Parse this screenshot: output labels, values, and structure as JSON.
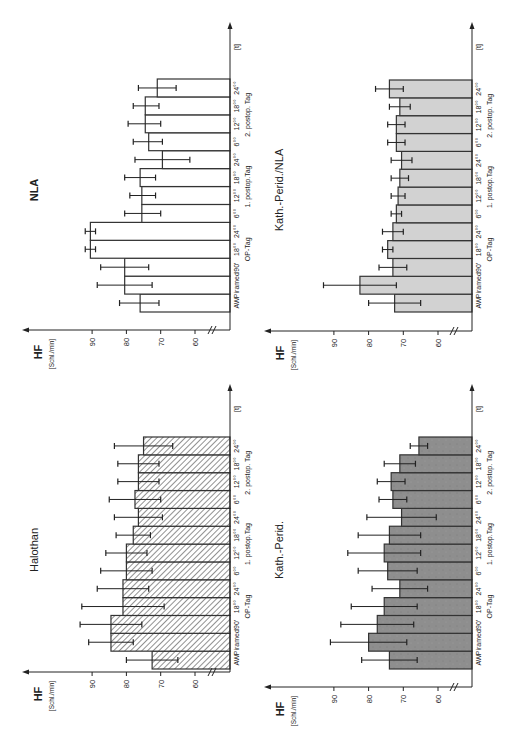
{
  "figure": {
    "y_axis_label": "HF",
    "y_axis_unit": "[Schl./min]",
    "time_axis_label": "[t]",
    "y_ticks": [
      60,
      70,
      80,
      90
    ],
    "time_labels": [
      "AW",
      "Piramed",
      "90'",
      "18°°",
      "24°°",
      "6°°",
      "12°°",
      "18°°",
      "24°°",
      "6°°",
      "12°°",
      "18°°",
      "24°°"
    ],
    "group_labels": [
      {
        "label": "OP-Tag",
        "from": 2,
        "to": 4
      },
      {
        "label": "1. postop.Tag",
        "from": 5,
        "to": 8
      },
      {
        "label": "2. postop. Tag",
        "from": 9,
        "to": 12
      }
    ]
  },
  "chart_data": [
    {
      "type": "bar",
      "title": "NLA",
      "xlabel": "[t]",
      "ylabel": "HF [Schl./min]",
      "ylim": [
        55,
        95
      ],
      "fill": "white",
      "categories": [
        "AW",
        "Piramed",
        "90'",
        "OP-Tag 18°°",
        "OP-Tag 24°°",
        "1. postop. 6°°",
        "1. postop. 12°°",
        "1. postop. 18°°",
        "1. postop. 24°°",
        "2. postop. 6°°",
        "2. postop. 12°°",
        "2. postop. 18°°",
        "2. postop. 24°°"
      ],
      "values": [
        76,
        80.5,
        80.5,
        90.5,
        90.5,
        75.5,
        75.5,
        76,
        69.5,
        73.5,
        74.5,
        74.5,
        71
      ],
      "error_minus": [
        5.5,
        8,
        7,
        1.5,
        1.5,
        5.5,
        4,
        4.5,
        8,
        4,
        4.5,
        4,
        5.5
      ],
      "error_plus": [
        6,
        8,
        7,
        1.5,
        1.5,
        5,
        3.5,
        4.5,
        8,
        4.5,
        5,
        3.5,
        5.5
      ],
      "grid": false,
      "orientation": "rotated 90° (bars extend left, time axis vertical)"
    },
    {
      "type": "bar",
      "title": "Kath.-Perid./NLA",
      "xlabel": "[t]",
      "ylabel": "HF [Schl./min]",
      "ylim": [
        55,
        95
      ],
      "fill": "light gray",
      "categories": [
        "AW",
        "Piramed",
        "90'",
        "OP-Tag 18°°",
        "OP-Tag 24°°",
        "1. postop. 6°°",
        "1. postop. 12°°",
        "1. postop. 18°°",
        "1. postop. 24°°",
        "2. postop. 6°°",
        "2. postop. 12°°",
        "2. postop. 18°°",
        "2. postop. 24°°"
      ],
      "values": [
        72.5,
        82.5,
        73,
        74.5,
        73,
        72,
        71.5,
        71,
        70.5,
        72,
        72,
        71,
        74
      ],
      "error_minus": [
        7.5,
        10.5,
        4,
        1.5,
        3,
        1.5,
        2,
        2.5,
        3,
        2.5,
        2.5,
        3,
        4
      ],
      "error_plus": [
        7.5,
        10.5,
        4,
        1.5,
        3,
        1.5,
        2,
        2.5,
        3,
        2.5,
        2.5,
        3,
        4
      ],
      "grid": false,
      "orientation": "rotated 90° (bars extend left, time axis vertical)"
    },
    {
      "type": "bar",
      "title": "Halothan",
      "xlabel": "[t]",
      "ylabel": "HF [Schl./min]",
      "ylim": [
        55,
        95
      ],
      "fill": "diagonal hatch",
      "categories": [
        "AW",
        "Piramed",
        "90'",
        "OP-Tag 18°°",
        "OP-Tag 24°°",
        "1. postop. 6°°",
        "1. postop. 12°°",
        "1. postop. 18°°",
        "1. postop. 24°°",
        "2. postop. 6°°",
        "2. postop. 12°°",
        "2. postop. 18°°",
        "2. postop. 24°°"
      ],
      "values": [
        72.5,
        84.5,
        84.5,
        81,
        81,
        80,
        80,
        78,
        76.5,
        77.5,
        76.5,
        76.5,
        75
      ],
      "error_minus": [
        7.5,
        6.5,
        9,
        12,
        7.5,
        7.5,
        6,
        5,
        7,
        7.5,
        6,
        6,
        8.5
      ],
      "error_plus": [
        7.5,
        6.5,
        9,
        12,
        7.5,
        7.5,
        6,
        5,
        7,
        7.5,
        6,
        6,
        8.5
      ],
      "grid": false,
      "orientation": "rotated 90° (bars extend left, time axis vertical)"
    },
    {
      "type": "bar",
      "title": "Kath.-Perid.",
      "xlabel": "[t]",
      "ylabel": "HF [Schl./min]",
      "ylim": [
        55,
        95
      ],
      "fill": "dark gray",
      "categories": [
        "AW",
        "Piramed",
        "90'",
        "OP-Tag 18°°",
        "OP-Tag 24°°",
        "1. postop. 6°°",
        "1. postop. 12°°",
        "1. postop. 18°°",
        "1. postop. 24°°",
        "2. postop. 6°°",
        "2. postop. 12°°",
        "2. postop. 18°°",
        "2. postop. 24°°"
      ],
      "values": [
        74,
        80,
        77.5,
        75.5,
        71,
        74.5,
        75.5,
        74,
        70.5,
        73,
        73.5,
        71,
        65.5
      ],
      "error_minus": [
        8,
        11,
        10.5,
        9.5,
        8,
        8.5,
        10.5,
        9,
        10,
        4,
        4,
        4.5,
        2.5
      ],
      "error_plus": [
        8,
        11,
        10.5,
        9.5,
        8,
        8.5,
        10.5,
        9,
        10,
        4,
        4,
        4.5,
        2.5
      ],
      "grid": false,
      "orientation": "rotated 90° (bars extend left, time axis vertical)"
    }
  ],
  "colors": {
    "axis": "#222222",
    "bar_stroke": "#333333",
    "nla_fill": "#ffffff",
    "kath_nla_fill": "#d2d2d2",
    "halothan_hatch": "#555555",
    "kath_fill": "#8e8e8e"
  }
}
